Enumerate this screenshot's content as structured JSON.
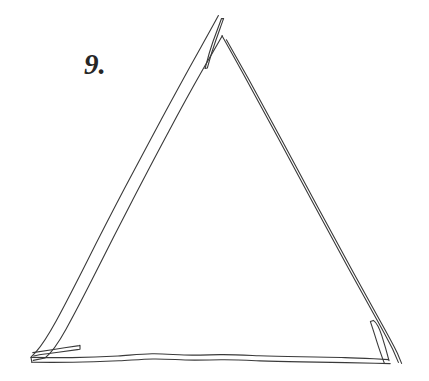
{
  "page": {
    "background_color": "#ffffff",
    "width": 429,
    "height": 381
  },
  "figure": {
    "label": "9.",
    "label_color": "#262626",
    "stroke_color": "#3a3a3a",
    "stroke_width": 1.1
  },
  "chart_data": {
    "type": "line",
    "xlabel": "",
    "ylabel": "",
    "xlim": [
      0,
      429
    ],
    "ylim": [
      381,
      0
    ],
    "grid": false,
    "legend": null,
    "annotations": [
      {
        "text": "9.",
        "x": 88,
        "y": 72
      }
    ],
    "vertices": {
      "apex": [
        222,
        36
      ],
      "bottom_left": [
        33,
        353
      ],
      "bottom_right": [
        392,
        361
      ]
    },
    "series": [
      {
        "name": "outer-left-edge",
        "points": [
          [
            218,
            16
          ],
          [
            196,
            55
          ],
          [
            170,
            101
          ],
          [
            144,
            149
          ],
          [
            118,
            198
          ],
          [
            93,
            247
          ],
          [
            70,
            292
          ],
          [
            50,
            327
          ],
          [
            36,
            349
          ],
          [
            31,
            356
          ]
        ]
      },
      {
        "name": "inner-left-edge",
        "points": [
          [
            222,
            36
          ],
          [
            202,
            69
          ],
          [
            177,
            114
          ],
          [
            151,
            161
          ],
          [
            125,
            210
          ],
          [
            101,
            257
          ],
          [
            78,
            300
          ],
          [
            57,
            335
          ],
          [
            40,
            355
          ],
          [
            33,
            360
          ]
        ]
      },
      {
        "name": "apex-overshoot-tail",
        "points": [
          [
            218,
            16
          ],
          [
            213,
            31
          ],
          [
            208,
            50
          ],
          [
            205,
            66
          ],
          [
            207,
            68
          ],
          [
            212,
            52
          ],
          [
            217,
            33
          ],
          [
            221,
            19
          ]
        ]
      },
      {
        "name": "outer-right-edge",
        "points": [
          [
            222,
            36
          ],
          [
            244,
            76
          ],
          [
            268,
            120
          ],
          [
            292,
            165
          ],
          [
            315,
            208
          ],
          [
            338,
            250
          ],
          [
            360,
            291
          ],
          [
            379,
            326
          ],
          [
            392,
            352
          ],
          [
            398,
            362
          ]
        ]
      },
      {
        "name": "inner-right-edge",
        "points": [
          [
            226,
            40
          ],
          [
            249,
            79
          ],
          [
            273,
            124
          ],
          [
            297,
            169
          ],
          [
            320,
            212
          ],
          [
            343,
            254
          ],
          [
            365,
            295
          ],
          [
            384,
            330
          ],
          [
            396,
            354
          ],
          [
            401,
            363
          ]
        ]
      },
      {
        "name": "baseline-outer",
        "points": [
          [
            31,
            357
          ],
          [
            70,
            358
          ],
          [
            110,
            357
          ],
          [
            150,
            355
          ],
          [
            190,
            354
          ],
          [
            230,
            355
          ],
          [
            270,
            356
          ],
          [
            310,
            357
          ],
          [
            350,
            358
          ],
          [
            372,
            359
          ],
          [
            388,
            360
          ]
        ]
      },
      {
        "name": "baseline-inner",
        "points": [
          [
            32,
            362
          ],
          [
            72,
            362
          ],
          [
            112,
            361
          ],
          [
            152,
            360
          ],
          [
            192,
            359
          ],
          [
            232,
            360
          ],
          [
            272,
            361
          ],
          [
            312,
            362
          ],
          [
            352,
            363
          ],
          [
            374,
            363
          ],
          [
            390,
            363
          ]
        ]
      },
      {
        "name": "bottom-left-overshoot-stub",
        "points": [
          [
            33,
            353
          ],
          [
            48,
            351
          ],
          [
            62,
            349
          ],
          [
            74,
            347
          ],
          [
            79,
            346
          ],
          [
            79,
            350
          ],
          [
            66,
            352
          ],
          [
            50,
            354
          ],
          [
            35,
            356
          ]
        ]
      },
      {
        "name": "bottom-right-overshoot-stub",
        "points": [
          [
            388,
            360
          ],
          [
            384,
            346
          ],
          [
            378,
            332
          ],
          [
            373,
            321
          ],
          [
            370,
            323
          ],
          [
            375,
            338
          ],
          [
            380,
            352
          ],
          [
            385,
            362
          ]
        ]
      }
    ]
  }
}
